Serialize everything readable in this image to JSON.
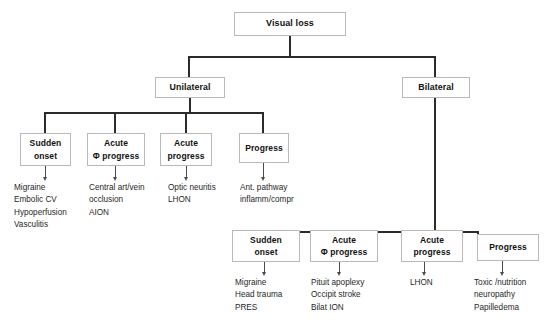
{
  "diagram": {
    "title": "Visual loss",
    "root": {
      "label": "Visual loss"
    },
    "level2": [
      {
        "label": "Unilateral"
      },
      {
        "label": "Bilateral"
      }
    ],
    "unilateral_branches": [
      {
        "box_line1": "Sudden",
        "box_line2": "onset",
        "items": [
          "Migraine",
          "Embolic CV",
          "Hypoperfusion",
          "Vasculitis"
        ]
      },
      {
        "box_line1": "Acute",
        "box_line2": "Φ progress",
        "items": [
          "Central art/vein",
          "occlusion",
          "AION"
        ]
      },
      {
        "box_line1": "Acute",
        "box_line2": "progress",
        "items": [
          "Optic neuritis",
          "LHON"
        ]
      },
      {
        "box_line1": "Progress",
        "box_line2": "",
        "items": [
          "Ant. pathway",
          "inflamm/compr"
        ]
      }
    ],
    "bilateral_branches": [
      {
        "box_line1": "Sudden",
        "box_line2": "onset",
        "items": [
          "Migraine",
          "Head trauma",
          "PRES"
        ]
      },
      {
        "box_line1": "Acute",
        "box_line2": "Φ progress",
        "items": [
          "Pituit apoplexy",
          "Occipit stroke",
          "Bilat ION"
        ]
      },
      {
        "box_line1": "Acute",
        "box_line2": "progress",
        "items": [
          "LHON"
        ]
      },
      {
        "box_line1": "Progress",
        "box_line2": "",
        "items": [
          "Toxic /nutrition",
          "neuropathy",
          "Papilledema"
        ]
      }
    ],
    "colors": {
      "background": "#ffffff",
      "box_border": "#b9b9b9",
      "connector": "#2b2b2b",
      "connector_thin": "#4a4a4a",
      "text": "#1a1a1a"
    }
  }
}
